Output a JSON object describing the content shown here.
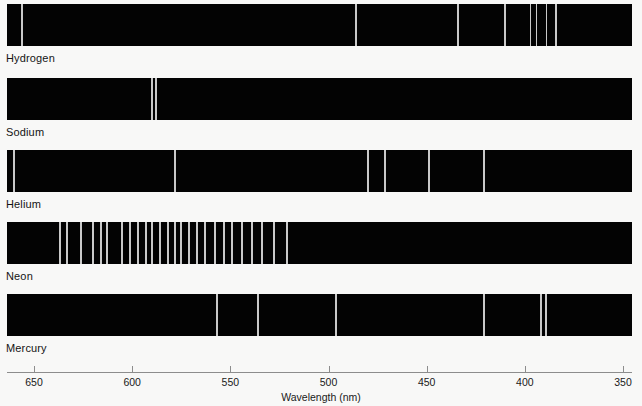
{
  "figure": {
    "axis_title": "Wavelength (nm)",
    "background_color": "#f8f8f7",
    "bar_color": "#030303",
    "line_color": "#c9c9c9"
  },
  "axis": {
    "label": "Wavelength (nm)",
    "min_nm": 350,
    "max_nm": 650,
    "direction": "decreasing-left-to-right",
    "ticks": [
      {
        "value": "650",
        "nm": 650
      },
      {
        "value": "600",
        "nm": 600
      },
      {
        "value": "550",
        "nm": 550
      },
      {
        "value": "500",
        "nm": 500
      },
      {
        "value": "450",
        "nm": 450
      },
      {
        "value": "400",
        "nm": 400
      },
      {
        "value": "350",
        "nm": 350
      }
    ]
  },
  "chart_data": {
    "type": "line",
    "xlabel": "Wavelength (nm)",
    "ylabel": "",
    "xlim": [
      650,
      350
    ],
    "grid": false,
    "legend": "none",
    "series": [
      {
        "name": "Hydrogen",
        "lines_nm": [
          656,
          486,
          434,
          410,
          397,
          394,
          389,
          384
        ],
        "line_widths_px": [
          2,
          2,
          2,
          2,
          1,
          1,
          1,
          2
        ]
      },
      {
        "name": "Sodium",
        "lines_nm": [
          590,
          588
        ],
        "line_widths_px": [
          2,
          2
        ]
      },
      {
        "name": "Helium",
        "lines_nm": [
          660,
          578,
          480,
          471,
          449,
          421
        ],
        "line_widths_px": [
          2,
          2,
          2,
          2,
          2,
          2
        ]
      },
      {
        "name": "Neon",
        "lines_nm": [
          637,
          633,
          626,
          620,
          616,
          613,
          605,
          601,
          597,
          593,
          590,
          586,
          582,
          578,
          575,
          571,
          567,
          563,
          558,
          553,
          549,
          544,
          539,
          534,
          528,
          521
        ],
        "line_widths_px": [
          2,
          2,
          2,
          2,
          2,
          2,
          2,
          2,
          2,
          2,
          2,
          2,
          2,
          2,
          2,
          2,
          2,
          2,
          2,
          2,
          2,
          2,
          2,
          2,
          2,
          2
        ]
      },
      {
        "name": "Mercury",
        "lines_nm": [
          557,
          536,
          496,
          421,
          392,
          389
        ],
        "line_widths_px": [
          2,
          2,
          2,
          2,
          2,
          2
        ]
      }
    ]
  }
}
